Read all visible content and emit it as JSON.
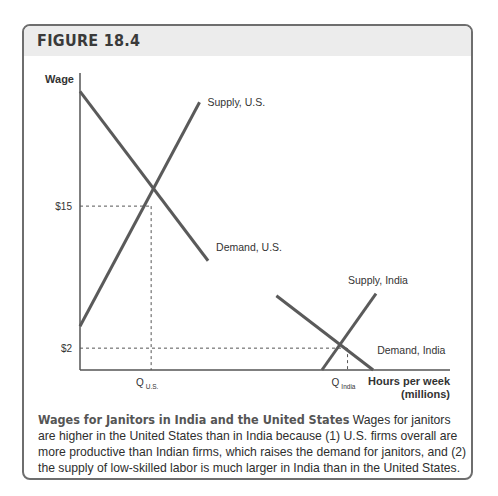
{
  "figure": {
    "label": "FIGURE 18.4",
    "caption_title": "Wages for Janitors in India and the United States",
    "caption_text": " Wages for janitors are higher in the United States than in India because (1) U.S. firms overall are more productive than Indian firms, which raises the demand for janitors, and (2) the supply of low-skilled labor is much larger in India than in the United States."
  },
  "chart_data": {
    "type": "line",
    "title": "Wages for Janitors in India and the United States",
    "xlabel": "Hours per week (millions)",
    "ylabel": "Wage",
    "y_ticks": [
      "$15",
      "$2"
    ],
    "x_ticks": [
      {
        "main": "Q",
        "sub": "U.S."
      },
      {
        "main": "Q",
        "sub": "India"
      }
    ],
    "grid": false,
    "series": [
      {
        "name": "Supply, U.S.",
        "kind": "supply",
        "points": [
          [
            0,
            4
          ],
          [
            4.2,
            24.5
          ]
        ]
      },
      {
        "name": "Demand, U.S.",
        "kind": "demand",
        "points": [
          [
            0,
            25.5
          ],
          [
            4.5,
            10
          ]
        ]
      },
      {
        "name": "Supply, India",
        "kind": "supply",
        "points": [
          [
            8.5,
            0
          ],
          [
            10.4,
            7
          ]
        ]
      },
      {
        "name": "Demand, India",
        "kind": "demand",
        "points": [
          [
            6.9,
            6.8
          ],
          [
            10.3,
            0
          ]
        ]
      }
    ],
    "equilibria": [
      {
        "label": "U.S.",
        "x": 2.5,
        "y": 15,
        "x_tick": "Q U.S.",
        "y_tick": "$15"
      },
      {
        "label": "India",
        "x": 9.4,
        "y": 2,
        "x_tick": "Q India",
        "y_tick": "$2"
      }
    ],
    "xlim": [
      0,
      13
    ],
    "ylim": [
      0,
      27
    ],
    "colors": {
      "lines": "#5a5a5a",
      "axes": "#555555",
      "guides": "#555555"
    }
  }
}
